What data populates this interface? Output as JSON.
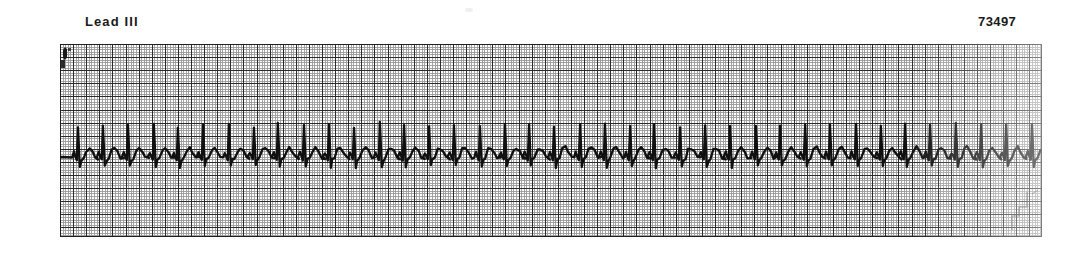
{
  "page": {
    "background_color": "#ffffff",
    "width": 1089,
    "height": 253
  },
  "header": {
    "lead_label": "Lead III",
    "record_number": "73497"
  },
  "strip": {
    "name": "ecg-rhythm-strip",
    "paper_color": "#ffffff",
    "grid_minor_color": "#9a9a9a",
    "grid_major_color": "#2b2b2b",
    "border_color": "#1f1f1f",
    "trace_color": "#111111",
    "minor_cell_px": 2.62,
    "major_cell_px": 13.1,
    "left": 60,
    "top": 44,
    "width": 982,
    "height": 193
  },
  "chart_data": {
    "type": "line",
    "title": "Lead III",
    "xlabel": "",
    "ylabel": "",
    "grid": true,
    "legend": "none",
    "annotations": [
      "Lead III",
      "73497"
    ],
    "trace_name": "Lead III",
    "baseline_y": 113,
    "rr_interval_px": 25.0,
    "beat_count": 39,
    "first_beat_x": 18,
    "ylim": [
      0,
      193
    ],
    "xlim": [
      0,
      982
    ],
    "beat_template": {
      "p_wave_amplitude": 5,
      "r_wave_amplitude": 33,
      "s_wave_depth": 10,
      "t_wave_amplitude": 9
    },
    "beat_offsets": [
      0,
      25,
      25,
      26,
      24,
      25,
      26,
      25,
      24,
      26,
      25,
      25,
      26,
      24,
      25,
      25,
      26,
      25,
      24,
      25,
      26,
      25,
      25,
      24,
      26,
      25,
      25,
      26,
      24,
      25,
      25,
      26,
      25,
      24,
      25,
      26,
      25,
      25,
      26
    ],
    "r_amplitudes": [
      30,
      33,
      31,
      34,
      29,
      33,
      32,
      30,
      34,
      31,
      33,
      30,
      34,
      32,
      31,
      33,
      30,
      34,
      32,
      31,
      33,
      32,
      30,
      34,
      31,
      33,
      32,
      30,
      33,
      31,
      34,
      32,
      30,
      33,
      31,
      34,
      32,
      31,
      33
    ]
  },
  "marks": {
    "calibration_mark": "upper-left-artifact",
    "stair_mark": "lower-right-artifact"
  }
}
